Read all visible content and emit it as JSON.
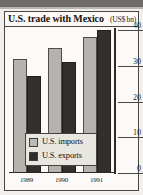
{
  "chart_data": {
    "type": "bar",
    "title": "U.S. trade with Mexico",
    "unit_label": "(US$ bn)",
    "xlabel": "",
    "ylabel": "",
    "categories": [
      "1989",
      "1990",
      "1991"
    ],
    "series": [
      {
        "name": "U.S. imports",
        "color": "#b5b3ae",
        "values": [
          32,
          35,
          38
        ]
      },
      {
        "name": "U.S. exports",
        "color": "#332f2c",
        "values": [
          27,
          31,
          40
        ]
      }
    ],
    "ylim": [
      0,
      40
    ],
    "yticks": [
      40,
      30,
      20,
      10,
      0
    ],
    "ytick_labels": [
      "40",
      "30",
      "20",
      "10",
      "0"
    ],
    "grid": false,
    "legend_position": "inside-bottom-center",
    "axis_side": "right"
  },
  "legend": {
    "entries": [
      {
        "label": "U.S. imports",
        "swatch": "imports"
      },
      {
        "label": "U.S. exports",
        "swatch": "exports"
      }
    ]
  }
}
